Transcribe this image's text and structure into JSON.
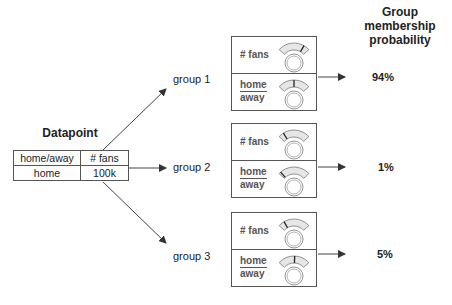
{
  "header": {
    "title_line1": "Group membership",
    "title_line2": "probability"
  },
  "datapoint": {
    "title": "Datapoint",
    "columns": [
      "home/away",
      "# fans"
    ],
    "values": [
      "home",
      "100k"
    ]
  },
  "groups": [
    {
      "label": "group 1",
      "features": [
        {
          "name": "# fans",
          "needle_angle": 30
        },
        {
          "name_num": "home",
          "name_den": "away",
          "needle_angle": 0
        }
      ],
      "probability": "94%"
    },
    {
      "label": "group 2",
      "features": [
        {
          "name": "# fans",
          "needle_angle": -32
        },
        {
          "name_num": "home",
          "name_den": "away",
          "needle_angle": -42
        }
      ],
      "probability": "1%"
    },
    {
      "label": "group 3",
      "features": [
        {
          "name": "# fans",
          "needle_angle": -30
        },
        {
          "name_num": "home",
          "name_den": "away",
          "needle_angle": 2
        }
      ],
      "probability": "5%"
    }
  ],
  "colors": {
    "line": "#444444",
    "gauge_fill": "#e6e6e6",
    "gauge_stroke": "#777777",
    "box_border": "#555555"
  }
}
